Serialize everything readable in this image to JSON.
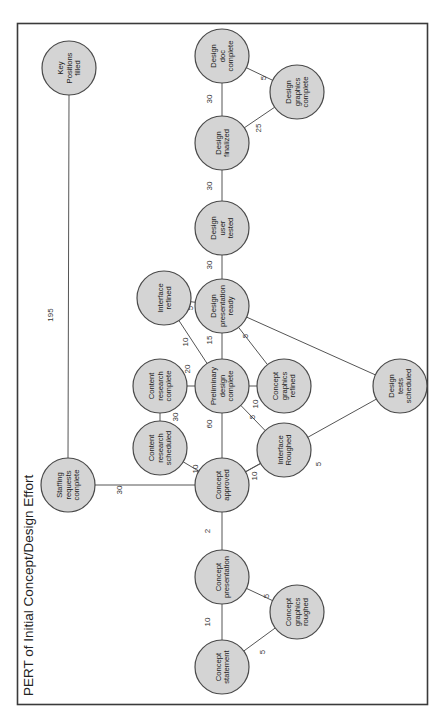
{
  "title": "PERT of Initial Concept/Design Effort",
  "colors": {
    "node_fill": "#d4d4d4",
    "node_stroke": "#4a4a4a",
    "edge": "#555555",
    "frame": "#3a3a3a",
    "background": "#ffffff"
  },
  "orientation": "rotated-90-ccw",
  "nodes": [
    {
      "id": "concept_statement",
      "lines": [
        "Concept",
        "statement"
      ]
    },
    {
      "id": "concept_presentation",
      "lines": [
        "Concept",
        "presentation"
      ]
    },
    {
      "id": "concept_graphics_roughed",
      "lines": [
        "Concept",
        "graphics",
        "roughed"
      ]
    },
    {
      "id": "concept_approved",
      "lines": [
        "Concept",
        "approved"
      ]
    },
    {
      "id": "staffing_requests_complete",
      "lines": [
        "Staffing",
        "requests",
        "complete"
      ]
    },
    {
      "id": "key_positions_filled",
      "lines": [
        "Key",
        "Positions",
        "filled"
      ]
    },
    {
      "id": "content_research_scheduled",
      "lines": [
        "Content",
        "research",
        "scheduled"
      ]
    },
    {
      "id": "content_research_complete",
      "lines": [
        "Content",
        "research",
        "complete"
      ]
    },
    {
      "id": "interface_roughed",
      "lines": [
        "Interface",
        "Roughed"
      ]
    },
    {
      "id": "preliminary_design_complete",
      "lines": [
        "Preliminary",
        "design",
        "complete"
      ]
    },
    {
      "id": "concept_graphics_refined",
      "lines": [
        "Concept",
        "graphics",
        "refined"
      ]
    },
    {
      "id": "interface_refined",
      "lines": [
        "Interface",
        "refined"
      ]
    },
    {
      "id": "design_presentation_ready",
      "lines": [
        "Design",
        "presentation",
        "ready"
      ]
    },
    {
      "id": "design_tests_scheduled",
      "lines": [
        "Design",
        "tests",
        "scheduled"
      ]
    },
    {
      "id": "design_user_tested",
      "lines": [
        "Design",
        "user",
        "tested"
      ]
    },
    {
      "id": "design_finalized",
      "lines": [
        "Design",
        "finalized"
      ]
    },
    {
      "id": "design_graphics_complete",
      "lines": [
        "Design",
        "graphics",
        "complete"
      ]
    },
    {
      "id": "design_doc_complete",
      "lines": [
        "Design",
        "doc",
        "complete"
      ]
    }
  ],
  "edges": [
    {
      "from": "concept_statement",
      "to": "concept_presentation",
      "label": "10"
    },
    {
      "from": "concept_statement",
      "to": "concept_graphics_roughed",
      "label": "5"
    },
    {
      "from": "concept_graphics_roughed",
      "to": "concept_presentation",
      "label": "5"
    },
    {
      "from": "concept_presentation",
      "to": "concept_approved",
      "label": "2"
    },
    {
      "from": "concept_approved",
      "to": "staffing_requests_complete",
      "label": "30"
    },
    {
      "from": "staffing_requests_complete",
      "to": "key_positions_filled",
      "label": "195"
    },
    {
      "from": "concept_approved",
      "to": "content_research_scheduled",
      "label": "10"
    },
    {
      "from": "content_research_scheduled",
      "to": "content_research_complete",
      "label": "30"
    },
    {
      "from": "content_research_complete",
      "to": "preliminary_design_complete",
      "label": "20"
    },
    {
      "from": "concept_approved",
      "to": "preliminary_design_complete",
      "label": "60"
    },
    {
      "from": "concept_approved",
      "to": "interface_roughed",
      "label": "10"
    },
    {
      "from": "interface_roughed",
      "to": "preliminary_design_complete",
      "label": "5"
    },
    {
      "from": "concept_approved",
      "to": "design_tests_scheduled",
      "label": "5"
    },
    {
      "from": "preliminary_design_complete",
      "to": "concept_graphics_refined",
      "label": "10"
    },
    {
      "from": "preliminary_design_complete",
      "to": "interface_refined",
      "label": "10"
    },
    {
      "from": "preliminary_design_complete",
      "to": "design_presentation_ready",
      "label": "15"
    },
    {
      "from": "concept_graphics_refined",
      "to": "design_presentation_ready",
      "label": "5"
    },
    {
      "from": "interface_refined",
      "to": "design_presentation_ready",
      "label": "5"
    },
    {
      "from": "design_tests_scheduled",
      "to": "design_presentation_ready",
      "label": ""
    },
    {
      "from": "design_presentation_ready",
      "to": "design_user_tested",
      "label": "30"
    },
    {
      "from": "design_user_tested",
      "to": "design_finalized",
      "label": "30"
    },
    {
      "from": "design_finalized",
      "to": "design_doc_complete",
      "label": "30"
    },
    {
      "from": "design_finalized",
      "to": "design_graphics_complete",
      "label": "25"
    },
    {
      "from": "design_graphics_complete",
      "to": "design_doc_complete",
      "label": "5"
    }
  ]
}
